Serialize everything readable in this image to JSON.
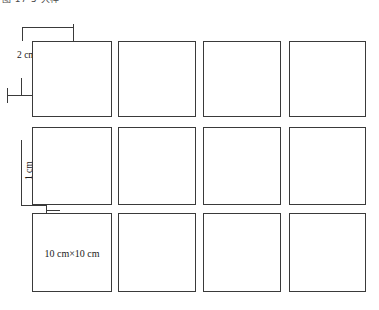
{
  "caption": {
    "text": "图 17-5 大样"
  },
  "diagram": {
    "line_color": "#3a3a3a",
    "background": "#ffffff",
    "tile": {
      "size_label": "10 cm×10 cm",
      "rows": 3,
      "columns": 4
    },
    "dimensions": {
      "top_gap_label": "2 cm",
      "left_gap_label": "1 cm"
    },
    "tiles": [
      {
        "row": 1,
        "col": 1,
        "label": ""
      },
      {
        "row": 1,
        "col": 2,
        "label": ""
      },
      {
        "row": 1,
        "col": 3,
        "label": ""
      },
      {
        "row": 1,
        "col": 4,
        "label": ""
      },
      {
        "row": 2,
        "col": 1,
        "label": ""
      },
      {
        "row": 2,
        "col": 2,
        "label": ""
      },
      {
        "row": 2,
        "col": 3,
        "label": ""
      },
      {
        "row": 2,
        "col": 4,
        "label": ""
      },
      {
        "row": 3,
        "col": 1,
        "label": "10 cm×10 cm"
      },
      {
        "row": 3,
        "col": 2,
        "label": ""
      },
      {
        "row": 3,
        "col": 3,
        "label": ""
      },
      {
        "row": 3,
        "col": 4,
        "label": ""
      }
    ]
  }
}
